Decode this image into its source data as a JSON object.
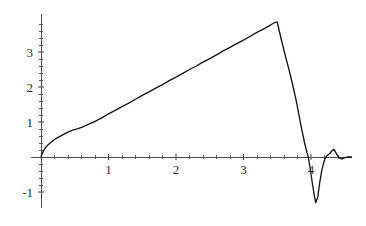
{
  "chart_data": {
    "type": "line",
    "title": "",
    "subtitle": "",
    "xlabel": "",
    "ylabel": "",
    "xlim": [
      -0.15,
      4.6
    ],
    "ylim": [
      -1.45,
      4.1
    ],
    "grid": false,
    "legend": null,
    "annotations": [],
    "axis_style": "cross-at-origin",
    "x_ticks_major": [
      1,
      2,
      3,
      4
    ],
    "x_tick_labels": [
      "1",
      "2",
      "3",
      "4"
    ],
    "y_ticks_major": [
      -1,
      1,
      2,
      3
    ],
    "y_tick_labels": [
      "-1",
      "1",
      "2",
      "3"
    ],
    "x_ticks_minor": [
      0.2,
      0.4,
      0.6,
      0.8,
      1.2,
      1.4,
      1.6,
      1.8,
      2.2,
      2.4,
      2.6,
      2.8,
      3.2,
      3.4,
      3.6,
      3.8,
      4.2,
      4.4
    ],
    "y_ticks_minor": [
      -0.8,
      -0.6,
      -0.4,
      -0.2,
      0.2,
      0.4,
      0.6,
      0.8,
      1.2,
      1.4,
      1.6,
      1.8,
      2.2,
      2.4,
      2.6,
      2.8,
      3.2,
      3.4,
      3.6,
      3.8
    ],
    "series": [
      {
        "name": "curve",
        "color": "#151515",
        "x": [
          0.0,
          0.03,
          0.06,
          0.1,
          0.15,
          0.2,
          0.26,
          0.32,
          0.4,
          0.47,
          0.55,
          0.62,
          0.7,
          0.8,
          0.9,
          1.0,
          1.1,
          1.2,
          1.3,
          1.4,
          1.5,
          1.6,
          1.7,
          1.8,
          1.9,
          2.0,
          2.1,
          2.2,
          2.3,
          2.4,
          2.5,
          2.6,
          2.7,
          2.8,
          2.9,
          3.0,
          3.1,
          3.2,
          3.3,
          3.4,
          3.45,
          3.5,
          3.53,
          3.58,
          3.63,
          3.68,
          3.73,
          3.78,
          3.82,
          3.86,
          3.9,
          3.93,
          3.96,
          3.99,
          4.02,
          4.05,
          4.07,
          4.1,
          4.13,
          4.16,
          4.19,
          4.22,
          4.25,
          4.28,
          4.31,
          4.34,
          4.37,
          4.4,
          4.43,
          4.46,
          4.5,
          4.55,
          4.6
        ],
        "y": [
          0.0,
          0.15,
          0.25,
          0.34,
          0.42,
          0.5,
          0.57,
          0.63,
          0.71,
          0.77,
          0.81,
          0.86,
          0.93,
          1.02,
          1.12,
          1.23,
          1.33,
          1.44,
          1.54,
          1.65,
          1.76,
          1.86,
          1.97,
          2.07,
          2.18,
          2.28,
          2.39,
          2.5,
          2.6,
          2.71,
          2.81,
          2.92,
          3.03,
          3.13,
          3.24,
          3.34,
          3.45,
          3.56,
          3.66,
          3.77,
          3.83,
          3.86,
          3.6,
          3.2,
          2.82,
          2.45,
          2.05,
          1.62,
          1.22,
          0.82,
          0.45,
          0.2,
          0.0,
          -0.35,
          -0.75,
          -1.12,
          -1.3,
          -1.15,
          -0.72,
          -0.38,
          -0.14,
          0.0,
          0.06,
          0.1,
          0.18,
          0.22,
          0.12,
          0.02,
          -0.04,
          -0.05,
          -0.02,
          0.0,
          0.0
        ]
      }
    ]
  },
  "axes": {
    "x_axis_name": "horizontal-axis",
    "y_axis_name": "vertical-axis"
  }
}
